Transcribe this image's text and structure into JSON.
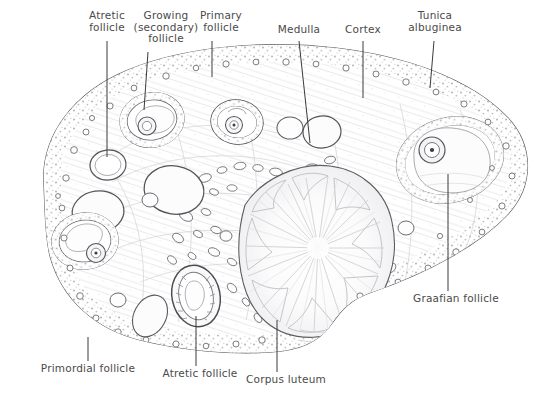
{
  "figure": {
    "kind": "histological-line-drawing",
    "background_color": "#ffffff",
    "ink_color": "#4a4a4a",
    "leader_line_color": "#3a3a3a"
  },
  "labels": [
    {
      "id": "atretic-follicle-top",
      "text": "Atretic\nfollicle",
      "x": 78,
      "y": 10,
      "w": 58,
      "anchor_x": 107,
      "anchor_y": 41,
      "tip_x": 107,
      "tip_y": 157
    },
    {
      "id": "growing-secondary",
      "text": "Growing\n(secondary)\nfollicle",
      "x": 128,
      "y": 10,
      "w": 76,
      "anchor_x": 148,
      "anchor_y": 52,
      "tip_x": 144,
      "tip_y": 110
    },
    {
      "id": "primary-follicle",
      "text": "Primary\nfollicle",
      "x": 192,
      "y": 10,
      "w": 58,
      "anchor_x": 212,
      "anchor_y": 41,
      "tip_x": 212,
      "tip_y": 77
    },
    {
      "id": "medulla",
      "text": "Medulla",
      "x": 273,
      "y": 24,
      "w": 52,
      "anchor_x": 299,
      "anchor_y": 41,
      "tip_x": 310,
      "tip_y": 143
    },
    {
      "id": "cortex",
      "text": "Cortex",
      "x": 340,
      "y": 24,
      "w": 46,
      "anchor_x": 363,
      "anchor_y": 41,
      "tip_x": 363,
      "tip_y": 98
    },
    {
      "id": "tunica-albuginea",
      "text": "Tunica\nalbuginea",
      "x": 404,
      "y": 10,
      "w": 62,
      "anchor_x": 434,
      "anchor_y": 41,
      "tip_x": 430,
      "tip_y": 88
    },
    {
      "id": "graafian-follicle",
      "text": "Graafian follicle",
      "x": 408,
      "y": 293,
      "w": 96,
      "anchor_x": 448,
      "anchor_y": 291,
      "tip_x": 448,
      "tip_y": 174
    },
    {
      "id": "primordial-follicle",
      "text": "Primordial follicle",
      "x": 36,
      "y": 363,
      "w": 104,
      "anchor_x": 88,
      "anchor_y": 361,
      "tip_x": 88,
      "tip_y": 337
    },
    {
      "id": "atretic-follicle-btm",
      "text": "Atretic follicle",
      "x": 156,
      "y": 368,
      "w": 88,
      "anchor_x": 196,
      "anchor_y": 366,
      "tip_x": 196,
      "tip_y": 316
    },
    {
      "id": "corpus-luteum",
      "text": "Corpus luteum",
      "x": 240,
      "y": 374,
      "w": 92,
      "anchor_x": 277,
      "anchor_y": 372,
      "tip_x": 277,
      "tip_y": 320
    }
  ],
  "structures": {
    "ovary_outline": "bean-shaped ovarian cross-section",
    "cortex": "outer stippled band containing primordial and growing follicles",
    "medulla": "central region with vascular spaces",
    "corpus_luteum": "large folded radial body, right of centre",
    "graafian_follicle": "large antral follicle with oocyte, upper right",
    "follicle_count": 12
  }
}
